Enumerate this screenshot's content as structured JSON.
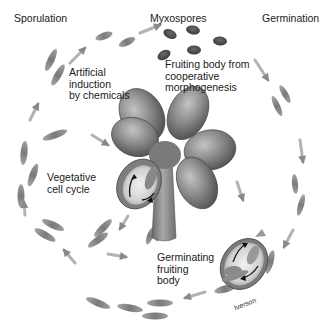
{
  "diagram": {
    "labels": {
      "sporulation": "Sporulation",
      "myxospores": "Myxospores",
      "germination": "Germination",
      "artificial_induction": "Artificial\ninduction\nby chemicals",
      "fruiting_body": "Fruiting body from\ncooperative\nmorphogenesis",
      "vegetative": "Vegetative\ncell cycle",
      "germinating": "Germinating\nfruiting\nbody",
      "credit": "Iverson"
    },
    "colors": {
      "background": "#ffffff",
      "cell": "#8a8a8a",
      "cell_dark": "#5e5e5e",
      "spore": "#4a4a4a",
      "arrow": "#9a9a9a",
      "fruiting_body": "#7d7d7d",
      "fruiting_body_light": "#b8b8b8",
      "text": "#1a1a1a"
    },
    "cells": [
      {
        "cx": 51,
        "cy": 60,
        "rx": 12,
        "ry": 3.5,
        "rot": -65
      },
      {
        "cx": 58,
        "cy": 75,
        "rx": 12,
        "ry": 3.5,
        "rot": -60
      },
      {
        "cx": 104,
        "cy": 36,
        "rx": 9,
        "ry": 3.5,
        "rot": -20
      },
      {
        "cx": 127,
        "cy": 42,
        "rx": 9,
        "ry": 3.5,
        "rot": -25
      },
      {
        "cx": 24,
        "cy": 153,
        "rx": 12,
        "ry": 3.5,
        "rot": -85
      },
      {
        "cx": 33,
        "cy": 175,
        "rx": 12,
        "ry": 3.5,
        "rot": -70
      },
      {
        "cx": 21,
        "cy": 196,
        "rx": 12,
        "ry": 3.5,
        "rot": -90
      },
      {
        "cx": 55,
        "cy": 135,
        "rx": 13,
        "ry": 3.5,
        "rot": -20
      },
      {
        "cx": 53,
        "cy": 225,
        "rx": 12,
        "ry": 3.5,
        "rot": 25
      },
      {
        "cx": 45,
        "cy": 235,
        "rx": 12,
        "ry": 3.5,
        "rot": 30
      },
      {
        "cx": 103,
        "cy": 228,
        "rx": 12,
        "ry": 3.5,
        "rot": -45
      },
      {
        "cx": 98,
        "cy": 240,
        "rx": 12,
        "ry": 3.5,
        "rot": -35
      },
      {
        "cx": 150,
        "cy": 236,
        "rx": 9,
        "ry": 3,
        "rot": -70
      },
      {
        "cx": 160,
        "cy": 233,
        "rx": 9,
        "ry": 3,
        "rot": -65
      },
      {
        "cx": 98,
        "cy": 303,
        "rx": 13,
        "ry": 3.5,
        "rot": 22
      },
      {
        "cx": 130,
        "cy": 308,
        "rx": 13,
        "ry": 3.5,
        "rot": 10
      },
      {
        "cx": 160,
        "cy": 303,
        "rx": 13,
        "ry": 3.5,
        "rot": 0
      },
      {
        "cx": 155,
        "cy": 316,
        "rx": 13,
        "ry": 3.5,
        "rot": 0
      },
      {
        "cx": 225,
        "cy": 289,
        "rx": 11,
        "ry": 3.5,
        "rot": -15
      },
      {
        "cx": 270,
        "cy": 262,
        "rx": 12,
        "ry": 3.5,
        "rot": -75
      },
      {
        "cx": 285,
        "cy": 94,
        "rx": 10,
        "ry": 3,
        "rot": 60
      },
      {
        "cx": 277,
        "cy": 106,
        "rx": 11,
        "ry": 3,
        "rot": 65
      },
      {
        "cx": 295,
        "cy": 184,
        "rx": 10,
        "ry": 3,
        "rot": 85
      },
      {
        "cx": 301,
        "cy": 205,
        "rx": 11,
        "ry": 3,
        "rot": 105
      },
      {
        "cx": 231,
        "cy": 278,
        "rx": 9,
        "ry": 3,
        "rot": -20
      }
    ],
    "spores": [
      {
        "cx": 170,
        "cy": 34,
        "rx": 7,
        "ry": 4.5,
        "rot": 25
      },
      {
        "cx": 193,
        "cy": 30,
        "rx": 7,
        "ry": 4.5,
        "rot": 10
      },
      {
        "cx": 220,
        "cy": 41,
        "rx": 7,
        "ry": 4.5,
        "rot": 5
      },
      {
        "cx": 194,
        "cy": 50,
        "rx": 7,
        "ry": 4.5,
        "rot": 0
      },
      {
        "cx": 164,
        "cy": 55,
        "rx": 7,
        "ry": 4.5,
        "rot": -30
      }
    ],
    "arrows": [
      {
        "x1": 30,
        "y1": 120,
        "x2": 38,
        "y2": 104
      },
      {
        "x1": 70,
        "y1": 63,
        "x2": 85,
        "y2": 48
      },
      {
        "x1": 140,
        "y1": 33,
        "x2": 160,
        "y2": 25
      },
      {
        "x1": 255,
        "y1": 60,
        "x2": 268,
        "y2": 80
      },
      {
        "x1": 300,
        "y1": 140,
        "x2": 303,
        "y2": 162
      },
      {
        "x1": 293,
        "y1": 230,
        "x2": 284,
        "y2": 247
      },
      {
        "x1": 205,
        "y1": 292,
        "x2": 185,
        "y2": 298
      },
      {
        "x1": 75,
        "y1": 263,
        "x2": 64,
        "y2": 250
      },
      {
        "x1": 25,
        "y1": 215,
        "x2": 24,
        "y2": 202
      },
      {
        "x1": 108,
        "y1": 254,
        "x2": 126,
        "y2": 257
      },
      {
        "x1": 92,
        "y1": 135,
        "x2": 108,
        "y2": 145
      },
      {
        "x1": 128,
        "y1": 216,
        "x2": 120,
        "y2": 229
      },
      {
        "x1": 237,
        "y1": 182,
        "x2": 243,
        "y2": 200
      }
    ]
  }
}
